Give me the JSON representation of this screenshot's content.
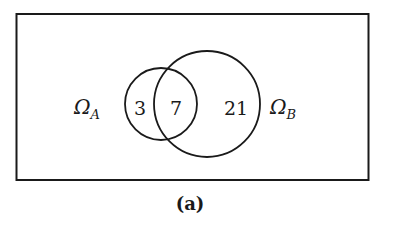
{
  "figure": {
    "caption": "(a)",
    "universe": {
      "label": "rectangle"
    },
    "sets": [
      {
        "name": "A",
        "symbol": "Ω",
        "subscript": "A"
      },
      {
        "name": "B",
        "symbol": "Ω",
        "subscript": "B"
      }
    ],
    "regions": {
      "a_only": "3",
      "a_and_b": "7",
      "b_only": "21"
    }
  },
  "colors": {
    "stroke": "#1a1a1a",
    "background": "#ffffff"
  }
}
